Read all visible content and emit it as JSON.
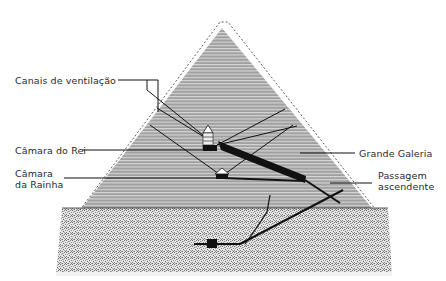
{
  "diagram": {
    "labels": {
      "ventilation_shafts": "Canais de ventilação",
      "kings_chamber": "Câmara do Rei",
      "queens_chamber_line1": "Câmara",
      "queens_chamber_line2": "da Rainha",
      "grand_gallery": "Grande Galeria",
      "ascending_passage_line1": "Passagem",
      "ascending_passage_line2": "ascendente"
    },
    "colors": {
      "pyramid_fill": "#9a9a9a",
      "stripe": "#d4d4d4",
      "bedrock": "#b8b8b8",
      "line": "#111111"
    }
  }
}
